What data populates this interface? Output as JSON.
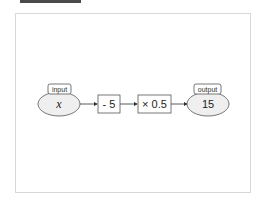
{
  "diagram": {
    "input": {
      "tag": "input",
      "value": "x"
    },
    "steps": [
      {
        "label": "- 5"
      },
      {
        "label": "× 0.5"
      }
    ],
    "output": {
      "tag": "output",
      "value": "15"
    },
    "colors": {
      "node_fill": "#efefef",
      "stroke": "#555555",
      "frame": "#d8d8d8"
    }
  }
}
